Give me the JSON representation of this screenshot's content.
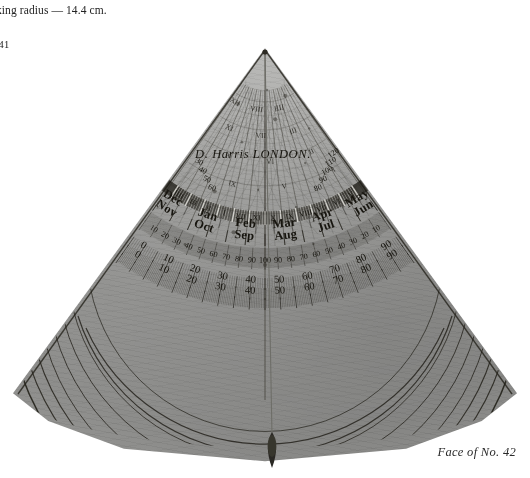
{
  "page": {
    "caption_lines": [
      "rking radius — 14.4 cm.",
      "ss",
      "/-41"
    ],
    "plate_caption": "Face of No. 42",
    "background_color": "#ffffff",
    "brass_color": "#9a9a94",
    "engraving_color": "#17150f"
  },
  "instrument": {
    "type": "astrolabe quadrant",
    "signature": "D. Harris LONDON.",
    "shape": "quarter-circle wedge, apex at top centre",
    "plumb": {
      "present": true,
      "bob_shape": "tear-drop",
      "thread_color": "#6e6e68"
    }
  },
  "scales": {
    "outer_degree": {
      "name": "outer degree arc",
      "labels": [
        "0",
        "10",
        "20",
        "30",
        "40",
        "50",
        "60",
        "70",
        "80",
        "90"
      ]
    },
    "inner_degree": {
      "name": "inner degree arc",
      "labels": [
        "0",
        "10",
        "20",
        "30",
        "40",
        "50",
        "60",
        "70",
        "80",
        "90"
      ]
    },
    "shadow_square": {
      "name": "shadow / sub-division scale",
      "labels": [
        "10",
        "20",
        "30",
        "40",
        "50",
        "60",
        "70",
        "80",
        "90",
        "100",
        "90",
        "80",
        "70",
        "60",
        "50",
        "40",
        "30",
        "20",
        "10"
      ]
    },
    "azimuth_arc_right": {
      "name": "upper right arc figures",
      "labels": [
        "80",
        "90",
        "100",
        "110",
        "120"
      ]
    },
    "azimuth_arc_left": {
      "name": "upper left arc figures",
      "labels": [
        "60",
        "50",
        "40",
        "30"
      ]
    }
  },
  "calendar_ring": {
    "name": "month ring",
    "months_outer": [
      "Nov",
      "Oct",
      "Sep",
      "Aug",
      "Jul",
      "Jun"
    ],
    "months_inner": [
      "Dec",
      "Jan",
      "Feb",
      "Mar",
      "Apr",
      "May"
    ]
  },
  "hour_lines": {
    "name": "unequal hour lines",
    "numerals": [
      "XII",
      "XI",
      "X",
      "IX",
      "VIII",
      "VII",
      "VI",
      "V",
      "IIII",
      "III",
      "II",
      "I"
    ]
  },
  "zodiac_band": {
    "name": "zodiac / declination band",
    "numerals": [
      "IIII",
      "III",
      "II",
      "I",
      "XII",
      "XI",
      "X",
      "IX",
      "VIII",
      "VII",
      "VI",
      "V"
    ]
  }
}
